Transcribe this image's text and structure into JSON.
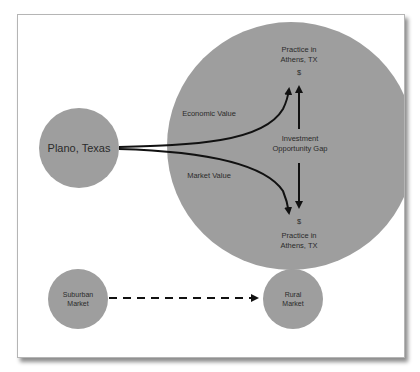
{
  "figure": {
    "colors": {
      "circle_fill": "#9e9e9e",
      "line": "#111111",
      "text": "#2b2b2b",
      "frame_border": "#b5b5b5"
    },
    "nodes": {
      "origin": {
        "label": "Plano, Texas"
      },
      "target_top": {
        "line1": "Practice in",
        "line2": "Athens, TX",
        "value_symbol": "$"
      },
      "target_bottom": {
        "line1": "Practice in",
        "line2": "Athens, TX",
        "value_symbol": "$"
      },
      "suburban": {
        "line1": "Suburban",
        "line2": "Market"
      },
      "rural": {
        "line1": "Rural",
        "line2": "Market"
      }
    },
    "edges": {
      "economic_value": {
        "label": "Economic Value"
      },
      "market_value": {
        "label": "Market Value"
      },
      "gap": {
        "line1": "Investment",
        "line2": "Opportunity Gap"
      }
    }
  }
}
